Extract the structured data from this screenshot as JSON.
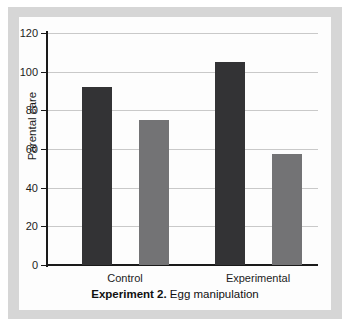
{
  "figure": {
    "caption_bold": "Experiment 2.",
    "caption_regular": " Egg manipulation"
  },
  "chart_data": {
    "type": "bar",
    "title": "",
    "xlabel": "",
    "ylabel": "Parental care",
    "categories": [
      "Control",
      "Experimental"
    ],
    "ylim": [
      0,
      120
    ],
    "yticks": [
      0,
      20,
      40,
      60,
      80,
      100,
      120
    ],
    "ytick_labels": [
      "0",
      "20",
      "40",
      "60",
      "80",
      "100",
      "120"
    ],
    "grid": true,
    "legend": "none",
    "series": [
      {
        "name": "dark",
        "color": "#333335",
        "values": [
          92,
          105
        ]
      },
      {
        "name": "grey",
        "color": "#737375",
        "values": [
          75,
          57.5
        ]
      }
    ],
    "bars": [
      {
        "category": "Control",
        "series": "dark",
        "value": 92,
        "label": ""
      },
      {
        "category": "Control",
        "series": "grey",
        "value": 75,
        "label": ""
      },
      {
        "category": "Experimental",
        "series": "dark",
        "value": 105,
        "label": ""
      },
      {
        "category": "Experimental",
        "series": "grey",
        "value": 57.5,
        "label": ""
      }
    ]
  }
}
